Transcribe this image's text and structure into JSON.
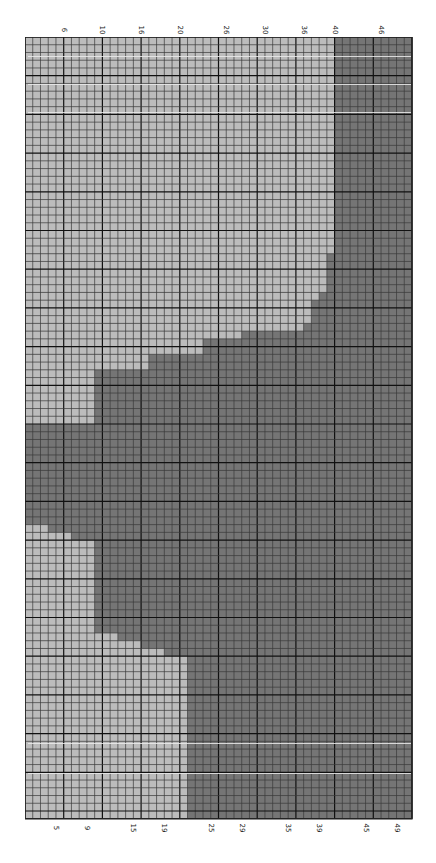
{
  "chart_data": {
    "type": "heatmap",
    "title": "",
    "grid": {
      "columns": 50,
      "rows": 101,
      "cell_px": 7.74,
      "major_every": 5
    },
    "colors": {
      "light": "#bcbcbc",
      "dark": "#757575",
      "minor_line": "#3a3a3a",
      "major_line": "#111111",
      "frame": "#222222"
    },
    "top_labels": [
      "6",
      "10",
      "16",
      "20",
      "26",
      "30",
      "36",
      "40",
      "46"
    ],
    "top_label_cols": [
      5,
      10,
      15,
      20,
      26,
      31,
      36,
      40,
      46
    ],
    "bottom_labels": [
      "5",
      "9",
      "15",
      "19",
      "25",
      "29",
      "35",
      "39",
      "45",
      "49"
    ],
    "bottom_label_cols": [
      4,
      8,
      14,
      18,
      24,
      28,
      34,
      38,
      44,
      48
    ],
    "light_region_by_row": [
      {
        "from_row": 0,
        "to_row": 28,
        "light_cols": 40
      },
      {
        "from_row": 28,
        "to_row": 33,
        "light_cols": 39
      },
      {
        "from_row": 33,
        "to_row": 34,
        "light_cols": 38
      },
      {
        "from_row": 34,
        "to_row": 37,
        "light_cols": 37
      },
      {
        "from_row": 37,
        "to_row": 38,
        "light_cols": 36
      },
      {
        "from_row": 38,
        "to_row": 39,
        "light_cols": 28
      },
      {
        "from_row": 39,
        "to_row": 41,
        "light_cols": 23
      },
      {
        "from_row": 41,
        "to_row": 43,
        "light_cols": 16
      },
      {
        "from_row": 43,
        "to_row": 50,
        "light_cols": 9
      },
      {
        "from_row": 50,
        "to_row": 63,
        "light_cols": 0
      },
      {
        "from_row": 63,
        "to_row": 64,
        "light_cols": 3
      },
      {
        "from_row": 64,
        "to_row": 65,
        "light_cols": 6
      },
      {
        "from_row": 65,
        "to_row": 77,
        "light_cols": 9
      },
      {
        "from_row": 77,
        "to_row": 78,
        "light_cols": 12
      },
      {
        "from_row": 78,
        "to_row": 79,
        "light_cols": 15
      },
      {
        "from_row": 79,
        "to_row": 80,
        "light_cols": 18
      },
      {
        "from_row": 80,
        "to_row": 101,
        "light_cols": 21
      }
    ],
    "highlight_streak_rows_y": [
      56,
      84,
      112,
      743,
      773
    ]
  }
}
